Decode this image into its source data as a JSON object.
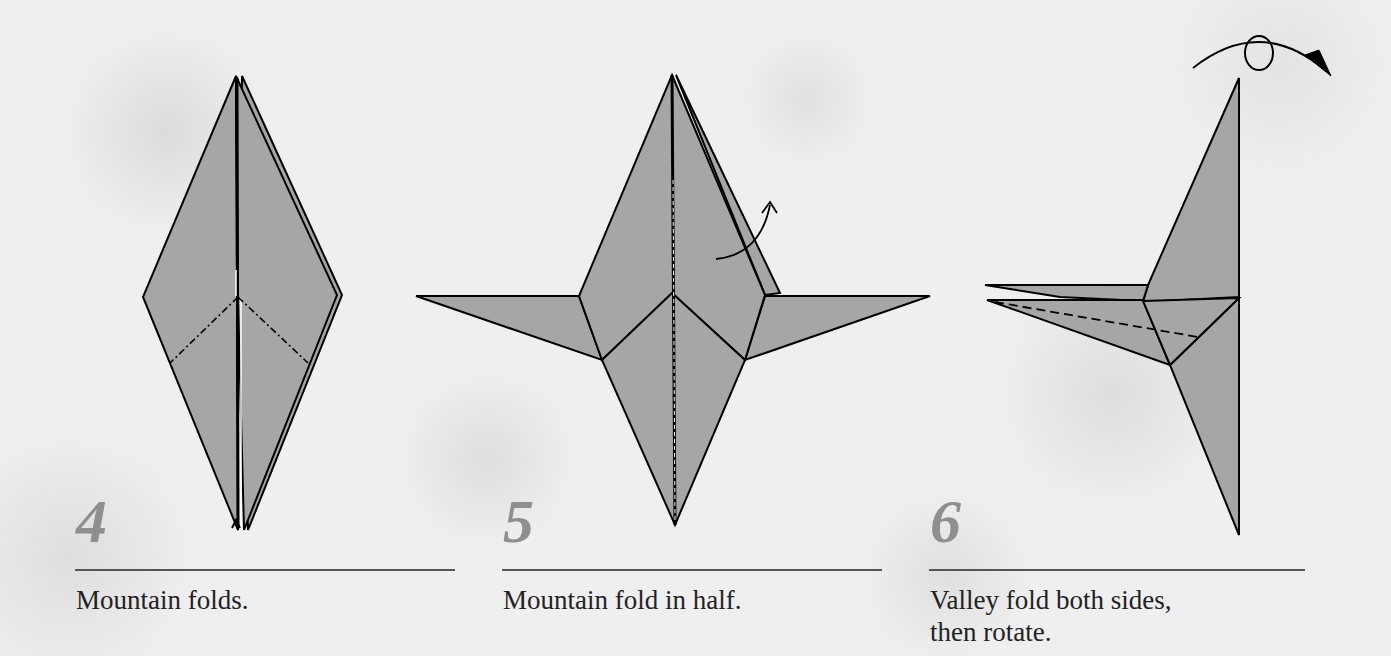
{
  "steps": [
    {
      "number": "4",
      "caption": "Mountain folds."
    },
    {
      "number": "5",
      "caption": "Mountain fold in half."
    },
    {
      "number": "6",
      "caption_line1": "Valley fold both sides,",
      "caption_line2": "then rotate."
    }
  ],
  "colors": {
    "paper_fill": "#a6a6a6",
    "outline": "#000000",
    "step_number": "#8f8f8f",
    "caption_text": "#222222",
    "rule": "#555555",
    "background": "#ececec"
  }
}
